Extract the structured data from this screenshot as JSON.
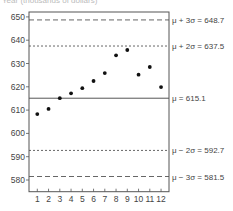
{
  "chart_data": {
    "type": "scatter",
    "title": "",
    "ylabel_partial": "Year (thousands of dollars)",
    "xlabel": "",
    "x": [
      1,
      2,
      3,
      4,
      5,
      6,
      7,
      8,
      9,
      10,
      11,
      12
    ],
    "values": [
      608.3,
      610.5,
      615.1,
      617.2,
      619.4,
      622.5,
      625.9,
      633.5,
      635.8,
      625.2,
      628.5,
      619.9
    ],
    "ylim": [
      575,
      653
    ],
    "xlim": [
      0.2,
      12.7
    ],
    "yticks": [
      580,
      590,
      600,
      610,
      620,
      630,
      640,
      650
    ],
    "xticks": [
      1,
      2,
      3,
      4,
      5,
      6,
      7,
      8,
      9,
      10,
      11,
      12
    ],
    "grid": false,
    "reference_lines": [
      {
        "name": "mu_plus_3sigma",
        "value": 648.7,
        "label": "μ + 3σ = 648.7",
        "style": "long-dash"
      },
      {
        "name": "mu_plus_2sigma",
        "value": 637.5,
        "label": "μ + 2σ = 637.5",
        "style": "dotted"
      },
      {
        "name": "mu",
        "value": 615.1,
        "label": "μ = 615.1",
        "style": "solid"
      },
      {
        "name": "mu_minus_2sigma",
        "value": 592.7,
        "label": "μ − 2σ = 592.7",
        "style": "dotted"
      },
      {
        "name": "mu_minus_3sigma",
        "value": 581.5,
        "label": "μ − 3σ = 581.5",
        "style": "long-dash"
      }
    ]
  },
  "colors": {
    "axis": "#555555",
    "points": "#111111",
    "lines": "#555555",
    "text": "#444444"
  }
}
